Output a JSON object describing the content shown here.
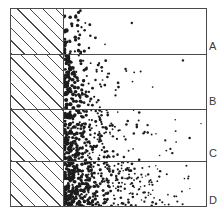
{
  "figure": {
    "frame": {
      "x": 10,
      "y": 8,
      "width": 197,
      "height": 199,
      "border_color": "#4a4a4a"
    },
    "hatch": {
      "name": "diagonal-hatch",
      "angle_deg": 45,
      "spacing_px": 9,
      "color": "#4a4a4a",
      "width_px": 53
    },
    "dot_color": "#1c1c1c"
  },
  "chart_data": {
    "type": "scatter",
    "xlabel": "",
    "ylabel": "",
    "grid": false,
    "legend_position": "right",
    "categories": [
      "A",
      "B",
      "C",
      "D"
    ],
    "series": [
      {
        "name": "A",
        "label": "A",
        "band_index": 0,
        "top_px": 0,
        "height_px": 45,
        "dot_count": 46,
        "density": 0.24,
        "max_radius_px": 2.0,
        "falloff": 0.072,
        "reach_px": 62,
        "seed": 11
      },
      {
        "name": "B",
        "label": "B",
        "band_index": 1,
        "top_px": 45,
        "height_px": 55,
        "dot_count": 150,
        "density": 0.48,
        "max_radius_px": 1.9,
        "falloff": 0.047,
        "reach_px": 96,
        "seed": 29
      },
      {
        "name": "C",
        "label": "C",
        "band_index": 2,
        "top_px": 100,
        "height_px": 52,
        "dot_count": 270,
        "density": 0.7,
        "max_radius_px": 1.8,
        "falloff": 0.034,
        "reach_px": 128,
        "seed": 47
      },
      {
        "name": "D",
        "label": "D",
        "band_index": 3,
        "top_px": 152,
        "height_px": 47,
        "dot_count": 430,
        "density": 1.0,
        "max_radius_px": 1.75,
        "falloff": 0.0255,
        "reach_px": 144,
        "seed": 83
      }
    ]
  },
  "labels": {
    "a": "A",
    "b": "B",
    "c": "C",
    "d": "D"
  }
}
